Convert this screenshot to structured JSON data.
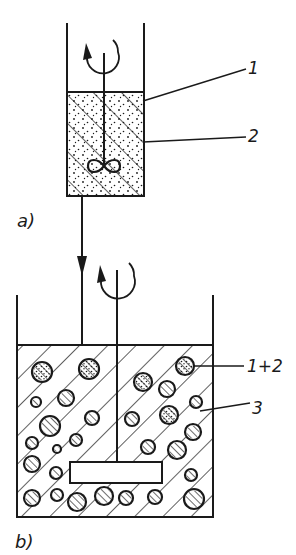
{
  "diagram": {
    "type": "process-schematic",
    "colors": {
      "ink": "#1a1a1a",
      "background": "#ffffff"
    },
    "panels": [
      {
        "id": "a",
        "label": "a)",
        "vessel": {
          "x": 67,
          "top": 23,
          "right": 144,
          "bottom": 196,
          "fill_top": 92
        },
        "stirrer": {
          "kind": "propeller",
          "shaft_x": 104,
          "shaft_top": 53,
          "hub_y": 166
        },
        "rotation_arrow": {
          "cx": 103,
          "cy": 52,
          "r": 16
        },
        "fill": {
          "hatch_direction": "forward-slash",
          "stipple": true
        },
        "callouts": [
          {
            "text": "1",
            "x": 248,
            "y": 60,
            "from": [
              143,
              101
            ],
            "to": [
              246,
              69
            ]
          },
          {
            "text": "2",
            "x": 248,
            "y": 128,
            "from": [
              143,
              142
            ],
            "to": [
              246,
              137
            ]
          }
        ]
      },
      {
        "id": "b",
        "label": "b)",
        "vessel": {
          "x": 17,
          "top": 295,
          "right": 213,
          "bottom": 517,
          "fill_top": 345
        },
        "stirrer": {
          "kind": "paddle",
          "shaft_x": 117,
          "shaft_top": 270,
          "paddle": {
            "x": 70,
            "y": 462,
            "w": 92,
            "h": 21
          }
        },
        "rotation_arrow": {
          "cx": 117,
          "cy": 276,
          "r": 17
        },
        "fill": {
          "hatch_direction": "back-slash",
          "stipple": false
        },
        "callouts": [
          {
            "text": "1+2",
            "x": 247,
            "y": 358,
            "from": [
              194,
              366
            ],
            "to": [
              244,
              366
            ]
          },
          {
            "text": "3",
            "x": 252,
            "y": 400,
            "from": [
              200,
              411
            ],
            "to": [
              250,
              403
            ]
          }
        ],
        "droplets": [
          {
            "cx": 42,
            "cy": 372,
            "r": 10,
            "dotted": true
          },
          {
            "cx": 89,
            "cy": 369,
            "r": 10,
            "dotted": true
          },
          {
            "cx": 185,
            "cy": 366,
            "r": 9,
            "dotted": true
          },
          {
            "cx": 143,
            "cy": 382,
            "r": 9,
            "dotted": true
          },
          {
            "cx": 167,
            "cy": 389,
            "r": 8,
            "dotted": false
          },
          {
            "cx": 66,
            "cy": 398,
            "r": 8,
            "dotted": false
          },
          {
            "cx": 36,
            "cy": 402,
            "r": 5,
            "dotted": false
          },
          {
            "cx": 196,
            "cy": 402,
            "r": 6,
            "dotted": false
          },
          {
            "cx": 169,
            "cy": 415,
            "r": 9,
            "dotted": true
          },
          {
            "cx": 92,
            "cy": 418,
            "r": 7,
            "dotted": false
          },
          {
            "cx": 132,
            "cy": 419,
            "r": 7,
            "dotted": false
          },
          {
            "cx": 50,
            "cy": 426,
            "r": 10,
            "dotted": false
          },
          {
            "cx": 193,
            "cy": 432,
            "r": 8,
            "dotted": false
          },
          {
            "cx": 76,
            "cy": 440,
            "r": 6,
            "dotted": false
          },
          {
            "cx": 32,
            "cy": 443,
            "r": 6,
            "dotted": false
          },
          {
            "cx": 148,
            "cy": 447,
            "r": 7,
            "dotted": false
          },
          {
            "cx": 57,
            "cy": 449,
            "r": 4,
            "dotted": false
          },
          {
            "cx": 177,
            "cy": 450,
            "r": 9,
            "dotted": false
          },
          {
            "cx": 32,
            "cy": 464,
            "r": 8,
            "dotted": false
          },
          {
            "cx": 56,
            "cy": 473,
            "r": 6,
            "dotted": false
          },
          {
            "cx": 191,
            "cy": 475,
            "r": 6,
            "dotted": false
          },
          {
            "cx": 32,
            "cy": 498,
            "r": 8,
            "dotted": false
          },
          {
            "cx": 57,
            "cy": 495,
            "r": 6,
            "dotted": false
          },
          {
            "cx": 77,
            "cy": 502,
            "r": 9,
            "dotted": false
          },
          {
            "cx": 104,
            "cy": 496,
            "r": 9,
            "dotted": false
          },
          {
            "cx": 126,
            "cy": 498,
            "r": 7,
            "dotted": false
          },
          {
            "cx": 155,
            "cy": 497,
            "r": 7,
            "dotted": false
          },
          {
            "cx": 194,
            "cy": 499,
            "r": 10,
            "dotted": false
          }
        ]
      }
    ],
    "transfer_pipe": {
      "x": 82,
      "from_y": 196,
      "to_y": 345,
      "arrow_y": 272
    },
    "panel_labels": {
      "a": {
        "text": "a)",
        "x": 17,
        "y": 212
      },
      "b": {
        "text": "b)",
        "x": 15,
        "y": 533
      }
    }
  }
}
